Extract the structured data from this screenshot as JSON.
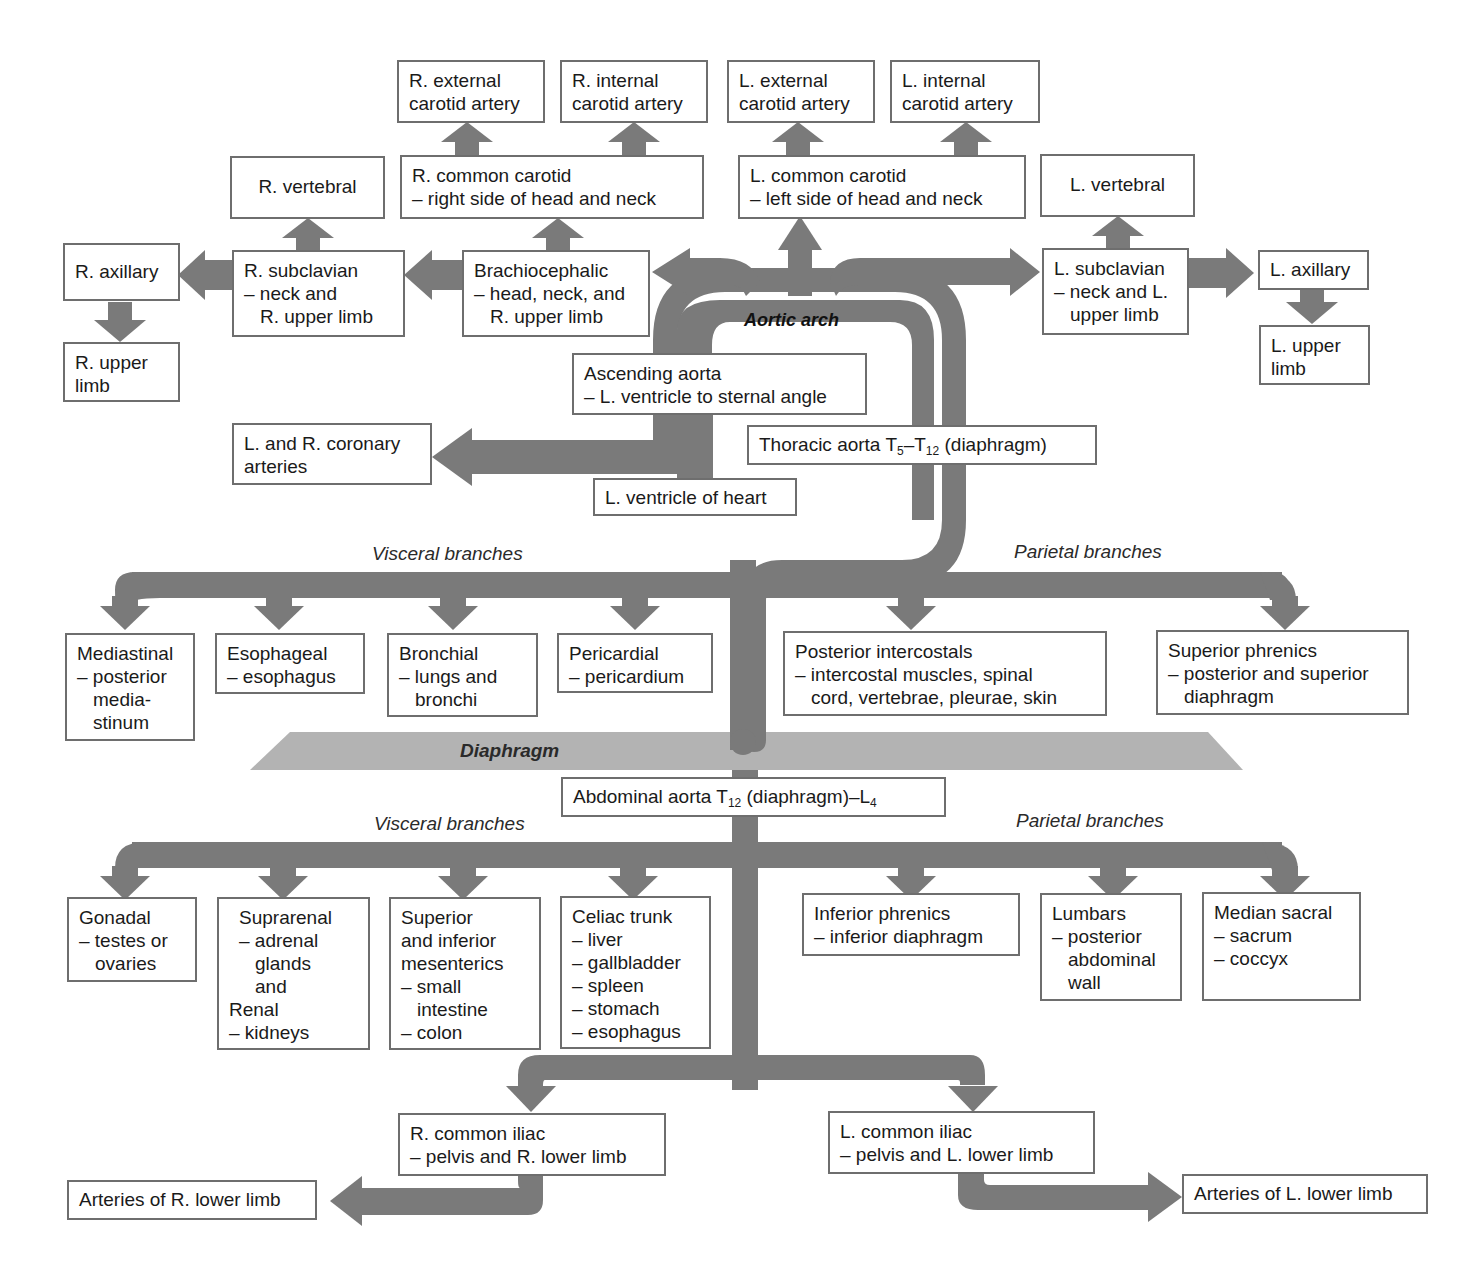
{
  "diagram": {
    "pipe_color": "#7a7a7a",
    "diaphragm_color": "#b3b3b3",
    "box_border_color": "#6e6e6e",
    "labels": {
      "aortic_arch": "Aortic arch",
      "diaphragm": "Diaphragm",
      "thoracic_visceral": "Visceral branches",
      "thoracic_parietal": "Parietal branches",
      "abdominal_visceral": "Visceral branches",
      "abdominal_parietal": "Parietal branches"
    },
    "head": {
      "r_external_carotid": [
        "R. external",
        "carotid artery"
      ],
      "r_internal_carotid": [
        "R. internal",
        "carotid artery"
      ],
      "l_external_carotid": [
        "L. external",
        "carotid artery"
      ],
      "l_internal_carotid": [
        "L. internal",
        "carotid artery"
      ],
      "r_common_carotid": [
        "R. common carotid",
        "– right side of head and neck"
      ],
      "l_common_carotid": [
        "L. common carotid",
        "– left side of head and neck"
      ],
      "r_vertebral": "R. vertebral",
      "l_vertebral": "L. vertebral"
    },
    "limbs_upper": {
      "r_axillary": "R. axillary",
      "r_upper_limb": [
        "R. upper",
        "limb"
      ],
      "r_subclavian": [
        "R. subclavian",
        "– neck and",
        "R. upper limb"
      ],
      "brachiocephalic": [
        "Brachiocephalic",
        "– head, neck, and",
        "R. upper limb"
      ],
      "l_subclavian": [
        "L. subclavian",
        "– neck and L.",
        "upper limb"
      ],
      "l_axillary": "L. axillary",
      "l_upper_limb": [
        "L. upper",
        "limb"
      ]
    },
    "heart": {
      "ascending_aorta": [
        "Ascending aorta",
        "– L. ventricle to sternal angle"
      ],
      "coronary": [
        "L. and R. coronary",
        "arteries"
      ],
      "l_ventricle": "L. ventricle of heart",
      "thoracic_aorta_prefix": "Thoracic aorta T",
      "thoracic_aorta_sub1": "5",
      "thoracic_aorta_mid": "–T",
      "thoracic_aorta_sub2": "12",
      "thoracic_aorta_suffix": " (diaphragm)"
    },
    "thoracic_visceral": [
      {
        "name": "Mediastinal",
        "lines": [
          "– posterior",
          "media-",
          "stinum"
        ]
      },
      {
        "name": "Esophageal",
        "lines": [
          "– esophagus"
        ]
      },
      {
        "name": "Bronchial",
        "lines": [
          "– lungs and",
          "bronchi"
        ]
      },
      {
        "name": "Pericardial",
        "lines": [
          "– pericardium"
        ]
      }
    ],
    "thoracic_parietal": [
      {
        "name": "Posterior intercostals",
        "lines": [
          "– intercostal muscles, spinal",
          "cord, vertebrae, pleurae, skin"
        ]
      },
      {
        "name": "Superior phrenics",
        "lines": [
          "– posterior and superior",
          "diaphragm"
        ]
      }
    ],
    "abdominal_aorta": {
      "prefix": "Abdominal aorta T",
      "sub1": "12",
      "mid": " (diaphragm)–L",
      "sub2": "4"
    },
    "abdominal_visceral": [
      {
        "name": "Gonadal",
        "lines": [
          "– testes or",
          "ovaries"
        ]
      },
      {
        "name": "Suprarenal",
        "lines": [
          "– adrenal",
          "glands",
          "and",
          "Renal",
          "– kidneys"
        ]
      },
      {
        "name": "Superior",
        "lines": [
          "and inferior",
          "mesenterics",
          "– small",
          "intestine",
          "– colon"
        ]
      },
      {
        "name": "Celiac trunk",
        "lines": [
          "– liver",
          "– gallbladder",
          "– spleen",
          "– stomach",
          "– esophagus"
        ]
      }
    ],
    "abdominal_parietal": [
      {
        "name": "Inferior phrenics",
        "lines": [
          "– inferior diaphragm"
        ]
      },
      {
        "name": "Lumbars",
        "lines": [
          "– posterior",
          "abdominal",
          "wall"
        ]
      },
      {
        "name": "Median sacral",
        "lines": [
          "– sacrum",
          "– coccyx"
        ]
      }
    ],
    "lower": {
      "r_common_iliac": [
        "R. common iliac",
        "– pelvis and R. lower limb"
      ],
      "l_common_iliac": [
        "L. common iliac",
        "– pelvis and L. lower limb"
      ],
      "r_lower_limb": "Arteries of R. lower limb",
      "l_lower_limb": "Arteries of L. lower limb"
    }
  }
}
